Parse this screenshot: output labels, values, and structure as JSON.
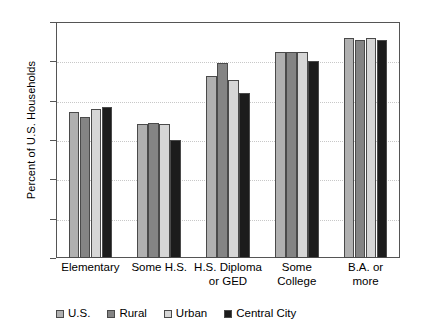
{
  "chart_data": {
    "type": "bar",
    "title": "",
    "xlabel": "",
    "ylabel": "Percent of U.S. Households",
    "ylim": [
      70,
      100
    ],
    "yticks": [
      70,
      75,
      80,
      85,
      90,
      95,
      100
    ],
    "ytick_labels": [
      "70",
      "75",
      "80",
      "85",
      "90",
      "95",
      "100"
    ],
    "grid": true,
    "grid_axis": "y",
    "legend_position": "bottom",
    "categories": [
      "Elementary",
      "Some H.S.",
      "H.S. Diploma or GED",
      "Some College",
      "B.A. or more"
    ],
    "category_lines": [
      [
        "Elementary"
      ],
      [
        "Some H.S."
      ],
      [
        "H.S. Diploma",
        "or GED"
      ],
      [
        "Some",
        "College"
      ],
      [
        "B.A. or",
        "more"
      ]
    ],
    "series": [
      {
        "name": "U.S.",
        "color": "#b0b0b0",
        "values": [
          88.6,
          87.0,
          93.1,
          96.2,
          98.0
        ]
      },
      {
        "name": "Rural",
        "color": "#848484",
        "values": [
          87.9,
          87.1,
          94.8,
          96.2,
          97.7
        ]
      },
      {
        "name": "Urban",
        "color": "#d6d6d6",
        "values": [
          88.9,
          87.0,
          92.6,
          96.2,
          98.0
        ]
      },
      {
        "name": "Central City",
        "color": "#1c1c1c",
        "values": [
          89.2,
          85.0,
          91.0,
          95.0,
          97.7
        ]
      }
    ]
  },
  "colors": {
    "axis": "#555555",
    "grid": "#c8c8c8",
    "background": "#ffffff",
    "text": "#000000"
  }
}
